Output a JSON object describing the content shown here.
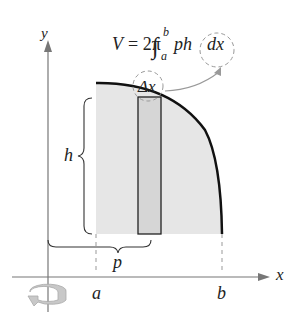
{
  "formula": {
    "lhs": "V",
    "equals": "= 2π",
    "integral": "∫",
    "upper": "b",
    "lower": "a",
    "integrand": "ph",
    "differential": "dx"
  },
  "labels": {
    "delta_x": "Δx",
    "h": "h",
    "p": "p",
    "a": "a",
    "b": "b",
    "x_axis": "x",
    "y_axis": "y"
  },
  "icons": {
    "rotation": "rotation-arrow-icon"
  },
  "colors": {
    "region_fill": "#e6e6e6",
    "rect_fill": "#d6d6d6",
    "curve": "#111111",
    "axis": "#777777",
    "dashed": "#999999"
  }
}
